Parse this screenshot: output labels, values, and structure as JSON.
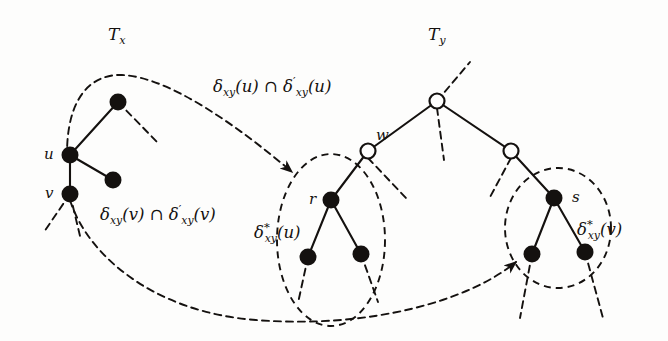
{
  "figure": {
    "kind": "graph-theory-diagram",
    "background_color": "#fdfdfc",
    "ink_color": "#14110f"
  },
  "labels": {
    "tree_x": "T",
    "tree_x_sub": "x",
    "tree_y": "T",
    "tree_y_sub": "y",
    "node_u": "u",
    "node_v": "v",
    "node_w": "w",
    "node_r": "r",
    "node_s": "s"
  },
  "set_labels": {
    "delta_u": {
      "delta": "δ",
      "sub": "xy",
      "arg": "(u)",
      "cap": "∩",
      "delta2": "δ",
      "prime": "′",
      "sub2": "xy",
      "arg2": "(u)",
      "full_text": "δxy(u) ∩ δ′xy(u)"
    },
    "delta_v": {
      "delta": "δ",
      "sub": "xy",
      "arg": "(v)",
      "cap": "∩",
      "delta2": "δ",
      "prime": "′",
      "sub2": "xy",
      "arg2": "(v)",
      "full_text": "δxy(v) ∩ δ′xy(v)"
    },
    "delta_star_u": {
      "delta": "δ",
      "star": "*",
      "sub": "xy",
      "arg": "(u)",
      "full_text": "δ*xy(u)"
    },
    "delta_star_v": {
      "delta": "δ",
      "star": "*",
      "sub": "xy",
      "arg": "(v)",
      "full_text": "δ*xy(v)"
    }
  },
  "nodes": {
    "filled": [
      {
        "name": "tx-top",
        "x": 118,
        "y": 102,
        "r": 8
      },
      {
        "name": "tx-u",
        "x": 70,
        "y": 155,
        "r": 8
      },
      {
        "name": "tx-u-child",
        "x": 113,
        "y": 180,
        "r": 8
      },
      {
        "name": "tx-v",
        "x": 70,
        "y": 194,
        "r": 8
      },
      {
        "name": "r-node",
        "x": 331,
        "y": 200,
        "r": 8
      },
      {
        "name": "r-left-leaf",
        "x": 308,
        "y": 257,
        "r": 8
      },
      {
        "name": "r-right-leaf",
        "x": 361,
        "y": 254,
        "r": 8
      },
      {
        "name": "s-node",
        "x": 554,
        "y": 198,
        "r": 8
      },
      {
        "name": "s-left-leaf",
        "x": 532,
        "y": 254,
        "r": 8
      },
      {
        "name": "s-right-leaf",
        "x": 585,
        "y": 252,
        "r": 8
      }
    ],
    "hollow": [
      {
        "name": "ty-root",
        "x": 437,
        "y": 101,
        "r": 7.5
      },
      {
        "name": "ty-w",
        "x": 368,
        "y": 151,
        "r": 7.5
      },
      {
        "name": "ty-right",
        "x": 511,
        "y": 151,
        "r": 7.5
      }
    ]
  },
  "counts": {
    "filled_nodes": 10,
    "hollow_nodes": 3,
    "dashed_regions": 4,
    "mapping_arrows": 2
  }
}
